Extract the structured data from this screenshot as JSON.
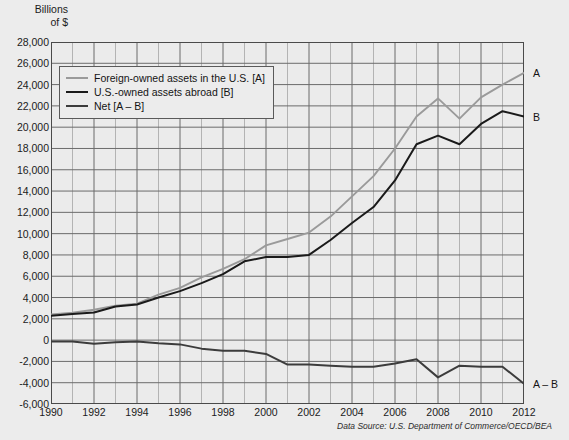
{
  "axis_title": "Billions\nof $",
  "source_note": "Data Source: U.S. Department of Commerce/OECD/BEA",
  "legend": {
    "items": [
      {
        "label": "Foreign-owned assets in the U.S. [A]",
        "color": "#9a9a9a"
      },
      {
        "label": "U.S.-owned assets abroad [B]",
        "color": "#1a1a1a"
      },
      {
        "label": "Net [A – B]",
        "color": "#3c3c3c"
      }
    ]
  },
  "end_labels": [
    {
      "text": "A",
      "value": 25100
    },
    {
      "text": "B",
      "value": 21000
    },
    {
      "text": "A – B",
      "value": -4100
    }
  ],
  "colors": {
    "background": "#ececec",
    "plot_background": "#ebebeb",
    "grid_minor": "#b3b3b3",
    "grid_major": "#6b6b6b",
    "axis": "#4a4a4a",
    "series_a": "#9a9a9a",
    "series_b": "#1a1a1a",
    "series_net": "#3c3c3c",
    "text": "#1b1b1b"
  },
  "chart_data": {
    "type": "line",
    "title": "",
    "subtitle": "",
    "xlabel": "",
    "ylabel": "Billions of $",
    "xlim": [
      1990,
      2012
    ],
    "ylim": [
      -6000,
      28000
    ],
    "ytick_step": 2000,
    "xtick_step": 2,
    "grid": true,
    "grid_minor_x_step": 1,
    "legend_position": "upper-left-inside",
    "yticks": [
      28000,
      26000,
      24000,
      22000,
      20000,
      18000,
      16000,
      14000,
      12000,
      10000,
      8000,
      6000,
      4000,
      2000,
      0,
      -2000,
      -4000,
      -6000
    ],
    "ytick_labels": [
      "28,000",
      "26,000",
      "24,000",
      "22,000",
      "20,000",
      "18,000",
      "16,000",
      "14,000",
      "12,000",
      "10,000",
      "8,000",
      "6,000",
      "4,000",
      "2,000",
      "0",
      "-2,000",
      "-4,000",
      "-6,000"
    ],
    "xticks": [
      1990,
      1992,
      1994,
      1996,
      1998,
      2000,
      2002,
      2004,
      2006,
      2008,
      2010,
      2012
    ],
    "xtick_labels": [
      "1990",
      "1992",
      "1994",
      "1996",
      "1998",
      "2000",
      "2002",
      "2004",
      "2006",
      "2008",
      "2010",
      "2012"
    ],
    "x": [
      1990,
      1991,
      1992,
      1993,
      1994,
      1995,
      1996,
      1997,
      1998,
      1999,
      2000,
      2001,
      2002,
      2003,
      2004,
      2005,
      2006,
      2007,
      2008,
      2009,
      2010,
      2011,
      2012
    ],
    "series": [
      {
        "name": "Foreign-owned assets in the U.S. [A]",
        "key": "A",
        "color": "#9a9a9a",
        "values": [
          2420,
          2570,
          2850,
          3240,
          3420,
          4280,
          4900,
          5900,
          6700,
          7600,
          8900,
          9500,
          10100,
          11600,
          13500,
          15400,
          18000,
          21000,
          22700,
          20800,
          22800,
          24000,
          25100
        ]
      },
      {
        "name": "U.S.-owned assets abroad [B]",
        "key": "B",
        "color": "#1a1a1a",
        "values": [
          2300,
          2450,
          2600,
          3150,
          3350,
          4000,
          4600,
          5350,
          6200,
          7400,
          7800,
          7800,
          8000,
          9400,
          11000,
          12500,
          15000,
          18400,
          19200,
          18400,
          20300,
          21500,
          21000
        ]
      },
      {
        "name": "Net [A – B]",
        "key": "A-B",
        "color": "#3c3c3c",
        "values": [
          -120,
          -130,
          -350,
          -200,
          -130,
          -300,
          -400,
          -800,
          -1000,
          -1000,
          -1300,
          -2300,
          -2300,
          -2400,
          -2500,
          -2500,
          -2200,
          -1800,
          -3500,
          -2400,
          -2500,
          -2500,
          -4100
        ]
      }
    ]
  }
}
